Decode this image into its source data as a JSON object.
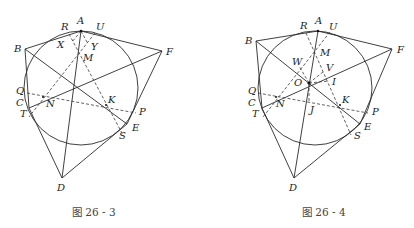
{
  "top_fragment": "",
  "figures": [
    {
      "id": "fig-26-3",
      "caption": "图 26 - 3",
      "labels": {
        "A": "A",
        "R": "R",
        "U": "U",
        "B": "B",
        "F": "F",
        "X": "X",
        "Y": "Y",
        "M": "M",
        "Q": "Q",
        "C": "C",
        "T": "T",
        "N": "N",
        "K": "K",
        "P": "P",
        "E": "E",
        "S": "S",
        "D": "D"
      }
    },
    {
      "id": "fig-26-4",
      "caption": "图 26 - 4",
      "labels": {
        "A": "A",
        "R": "R",
        "U": "U",
        "B": "B",
        "F": "F",
        "W": "W",
        "M": "M",
        "V": "V",
        "O": "O",
        "I": "I",
        "Q": "Q",
        "C": "C",
        "T": "T",
        "N": "N",
        "J": "J",
        "K": "K",
        "P": "P",
        "E": "E",
        "S": "S",
        "D": "D"
      }
    }
  ]
}
